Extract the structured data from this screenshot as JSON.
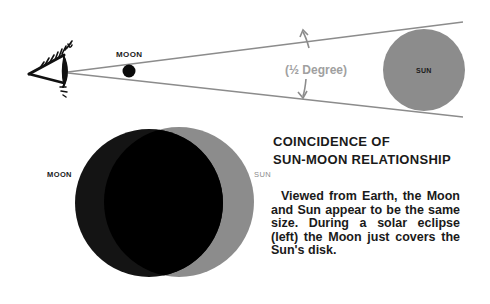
{
  "diagram": {
    "top": {
      "moon_label": "MOON",
      "sun_label": "SUN",
      "angle_label": "(½ Degree)",
      "icons": [
        "eye-icon"
      ]
    },
    "bottom": {
      "moon_label": "MOON",
      "sun_label": "SUN",
      "title_line1": "COINCIDENCE OF",
      "title_line2": "SUN-MOON RELATIONSHIP",
      "description": "Viewed from Earth, the Moon and Sun appear to be the same size. During a solar eclipse (left) the Moon just covers the Sun's disk."
    },
    "colors": {
      "sun": "#8c8c8c",
      "moon": "#0a0a0a",
      "line": "#8c8c8c",
      "angle_text": "#a0a0a0"
    }
  }
}
